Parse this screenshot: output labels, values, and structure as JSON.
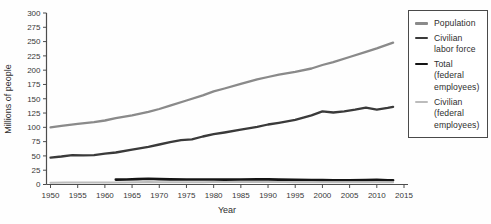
{
  "chart_data": {
    "type": "line",
    "title": "",
    "xlabel": "Year",
    "ylabel": "Millions of people",
    "xlim": [
      1950,
      2015
    ],
    "ylim": [
      0,
      300
    ],
    "x_tick_step": 5,
    "y_tick_step": 25,
    "grid": false,
    "legend_position": "right",
    "x_tick_labels": [
      "1950",
      "1955",
      "1960",
      "1965",
      "1970",
      "1975",
      "1980",
      "1985",
      "1990",
      "1995",
      "2000",
      "2005",
      "2010",
      "2015"
    ],
    "y_tick_labels": [
      "0",
      "25",
      "50",
      "75",
      "100",
      "125",
      "150",
      "175",
      "200",
      "225",
      "250",
      "275",
      "300"
    ],
    "series": [
      {
        "key": "population",
        "label": "Population",
        "label_lines": [
          "Population"
        ],
        "color": "#8a8a8a",
        "stroke_width": 2.3,
        "x": [
          1950,
          1952,
          1955,
          1958,
          1960,
          1962,
          1965,
          1968,
          1970,
          1972,
          1975,
          1978,
          1980,
          1982,
          1985,
          1988,
          1990,
          1992,
          1995,
          1998,
          2000,
          2002,
          2005,
          2008,
          2010,
          2013
        ],
        "values": [
          100,
          102.5,
          106,
          109,
          112,
          116,
          121,
          127,
          132,
          138,
          147,
          156,
          163,
          168,
          176,
          184,
          188,
          192,
          197,
          203,
          209,
          214,
          223,
          232,
          238,
          248
        ]
      },
      {
        "key": "civilian-labor-force",
        "label": "Civilian labor force",
        "label_lines": [
          "Civilian",
          "labor force"
        ],
        "color": "#3a3a3a",
        "stroke_width": 2.3,
        "x": [
          1950,
          1952,
          1954,
          1956,
          1958,
          1960,
          1962,
          1965,
          1968,
          1970,
          1972,
          1974,
          1976,
          1978,
          1980,
          1982,
          1985,
          1988,
          1990,
          1992,
          1995,
          1998,
          2000,
          2002,
          2004,
          2006,
          2008,
          2010,
          2012,
          2013
        ],
        "values": [
          47,
          49,
          51.5,
          51,
          51.5,
          54,
          56,
          61,
          66,
          70,
          74,
          77.5,
          79,
          84,
          88,
          91,
          96,
          101,
          105,
          108,
          113,
          121,
          128,
          126,
          128,
          131,
          134.5,
          131,
          134,
          136
        ]
      },
      {
        "key": "total-federal-employees",
        "label": "Total (federal employees)",
        "label_lines": [
          "Total",
          "(federal",
          "employees)"
        ],
        "color": "#141414",
        "stroke_width": 2.6,
        "x": [
          1962,
          1964,
          1966,
          1968,
          1970,
          1972,
          1975,
          1978,
          1980,
          1982,
          1985,
          1988,
          1990,
          1992,
          1995,
          1998,
          2000,
          2002,
          2005,
          2008,
          2010,
          2012,
          2013
        ],
        "values": [
          8.5,
          8.8,
          9.4,
          10,
          9.4,
          8.9,
          8.7,
          8.7,
          8.7,
          8.5,
          8.8,
          8.9,
          9,
          8.6,
          8.1,
          7.8,
          7.7,
          7.6,
          7.5,
          7.7,
          8.1,
          7.6,
          7.4
        ]
      },
      {
        "key": "civilian-federal-employees",
        "label": "Civilian (federal employees)",
        "label_lines": [
          "Civilian",
          "(federal",
          "employees)"
        ],
        "color": "#bcbcbc",
        "stroke_width": 2.0,
        "x": [
          1950,
          1953,
          1955,
          1958,
          1960,
          1963,
          1966,
          1968,
          1970,
          1973,
          1975,
          1978,
          1980,
          1983,
          1985,
          1988,
          1990,
          1993,
          1995,
          1998,
          2000,
          2003,
          2005,
          2008,
          2010,
          2013
        ],
        "values": [
          3.2,
          3.4,
          3.5,
          3.3,
          3.4,
          3.6,
          4.1,
          4.3,
          4.1,
          4,
          4.1,
          4.1,
          4.2,
          4.2,
          4.4,
          4.5,
          4.6,
          4.3,
          4.1,
          3.9,
          3.9,
          3.8,
          3.8,
          3.9,
          4.2,
          4
        ]
      }
    ],
    "colors": {
      "axis": "#4d4d4d",
      "tick_text": "#383838",
      "legend_border": "#4a4a4a",
      "background": "#ffffff"
    }
  }
}
